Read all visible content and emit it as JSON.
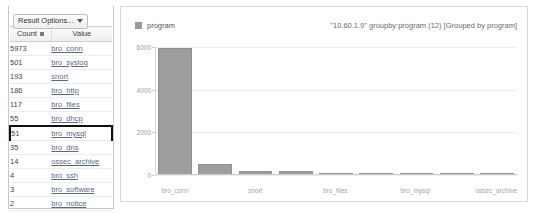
{
  "results_panel": {
    "result_options_label": "Result Options...",
    "columns": [
      "Count",
      "Value"
    ],
    "rows": [
      {
        "count": "5973",
        "value": "bro_conn",
        "selected": false
      },
      {
        "count": "501",
        "value": "bro_syslog",
        "selected": false
      },
      {
        "count": "193",
        "value": "snort",
        "selected": false
      },
      {
        "count": "186",
        "value": "bro_http",
        "selected": false
      },
      {
        "count": "117",
        "value": "bro_files",
        "selected": false
      },
      {
        "count": "55",
        "value": "bro_dhcp",
        "selected": false
      },
      {
        "count": "51",
        "value": "bro_mysql",
        "selected": true
      },
      {
        "count": "35",
        "value": "bro_dns",
        "selected": false
      },
      {
        "count": "14",
        "value": "ossec_archive",
        "selected": false
      },
      {
        "count": "4",
        "value": "bro_ssh",
        "selected": false
      },
      {
        "count": "3",
        "value": "bro_software",
        "selected": false
      },
      {
        "count": "2",
        "value": "bro_notice",
        "selected": false
      }
    ]
  },
  "chart_data": {
    "type": "bar",
    "title": "\"10.60.1.9\" groupby:program (12) [Grouped by program]",
    "xlabel": "",
    "ylabel": "",
    "grid": true,
    "legend_position": "top-left",
    "legend": [
      "program"
    ],
    "series_name": "program",
    "bar_color": "#9e9e9e",
    "ylim": [
      0,
      6000
    ],
    "yticks": [
      0,
      2000,
      4000,
      6000
    ],
    "ytick_labels": [
      "0",
      "2000",
      "4000",
      "6000"
    ],
    "categories": [
      "bro_conn",
      "bro_syslog",
      "snort",
      "bro_http",
      "bro_files",
      "bro_dhcp",
      "bro_mysql",
      "bro_dns",
      "ossec_archive"
    ],
    "xtick_labels": [
      "bro_conn",
      "",
      "snort",
      "",
      "bro_files",
      "",
      "bro_mysql",
      "",
      "ossec_archive"
    ],
    "values": [
      5973,
      501,
      193,
      186,
      117,
      55,
      51,
      35,
      14
    ]
  }
}
